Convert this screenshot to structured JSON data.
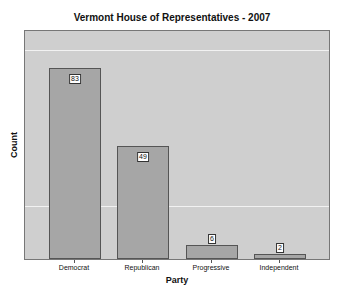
{
  "chart_data": {
    "type": "bar",
    "title": "Vermont House of Representatives - 2007",
    "xlabel": "Party",
    "ylabel": "Count",
    "categories": [
      "Democrat",
      "Republican",
      "Progressive",
      "Independent"
    ],
    "values": [
      83,
      49,
      6,
      2
    ],
    "data_labels": [
      "83",
      "49",
      "6",
      "2"
    ],
    "ylim": [
      0,
      100
    ],
    "grid": true,
    "legend": "none",
    "colors": {
      "bar": "#a6a6a6",
      "panel": "#cfcfcf",
      "gridline": "#f2f2f2"
    }
  }
}
